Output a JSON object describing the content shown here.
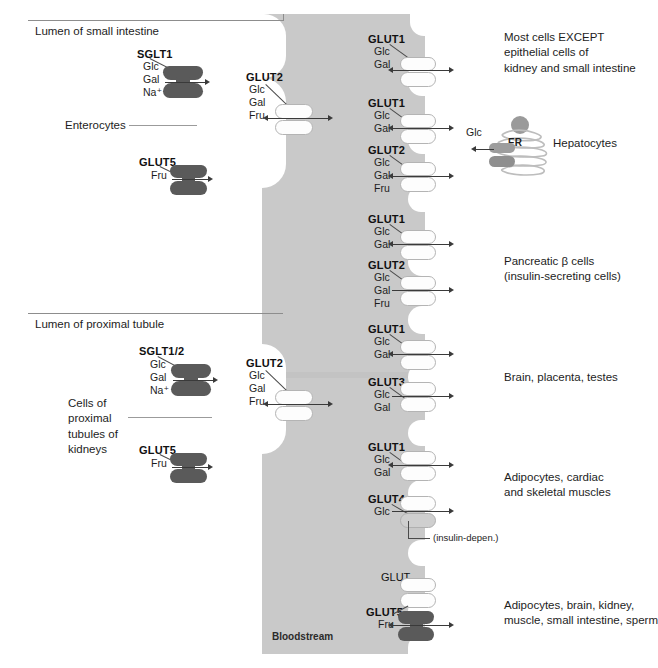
{
  "figure": {
    "bloodstream_label": "Bloodstream"
  },
  "colors": {
    "bloodstream_fill": "#c9c9c9",
    "dark_transporter": "#5a5a5a",
    "light_transporter": "#fdfdfd",
    "medium_transporter": "#cfcfcf",
    "text": "#1d1d1d",
    "rule": "#8d8d8d"
  },
  "panels": {
    "intestine": {
      "lumen_label": "Lumen of small intestine",
      "cell_label": "Enterocytes",
      "apical": [
        {
          "name": "SGLT1",
          "substrates": [
            "Glc",
            "Gal",
            "Na⁺"
          ],
          "direction": "right"
        },
        {
          "name": "GLUT5",
          "substrates": [
            "Fru"
          ],
          "direction": "right"
        }
      ],
      "basolateral": [
        {
          "name": "GLUT2",
          "substrates": [
            "Glc",
            "Gal",
            "Fru"
          ],
          "direction": "both"
        }
      ]
    },
    "kidney": {
      "lumen_label": "Lumen of proximal tubule",
      "cell_label": "Cells of\nproximal\ntubules of\nkidneys",
      "apical": [
        {
          "name": "SGLT1/2",
          "substrates": [
            "Glc",
            "Gal",
            "Na⁺"
          ],
          "direction": "right"
        },
        {
          "name": "GLUT5",
          "substrates": [
            "Fru"
          ],
          "direction": "right"
        }
      ],
      "basolateral": [
        {
          "name": "GLUT2",
          "substrates": [
            "Glc",
            "Gal",
            "Fru"
          ],
          "direction": "both"
        }
      ]
    },
    "bloodstream_right": {
      "transporters": [
        {
          "name": "GLUT1",
          "substrates": [
            "Glc",
            "Gal"
          ],
          "direction": "both",
          "style": "light"
        },
        {
          "name": "GLUT1",
          "substrates": [
            "Glc",
            "Gal"
          ],
          "direction": "both",
          "style": "light"
        },
        {
          "name": "GLUT2",
          "substrates": [
            "Glc",
            "Gal",
            "Fru"
          ],
          "direction": "both",
          "style": "light"
        },
        {
          "name": "GLUT1",
          "substrates": [
            "Glc",
            "Gal"
          ],
          "direction": "both",
          "style": "light"
        },
        {
          "name": "GLUT2",
          "substrates": [
            "Glc",
            "Gal",
            "Fru"
          ],
          "direction": "right",
          "style": "light"
        },
        {
          "name": "GLUT1",
          "substrates": [
            "Glc",
            "Gal"
          ],
          "direction": "both",
          "style": "light"
        },
        {
          "name": "GLUT3",
          "substrates": [
            "Glc",
            "Gal"
          ],
          "direction": "right",
          "style": "light"
        },
        {
          "name": "GLUT1",
          "substrates": [
            "Glc",
            "Gal"
          ],
          "direction": "both",
          "style": "light"
        },
        {
          "name": "GLUT4",
          "substrates": [
            "Glc"
          ],
          "direction": "right",
          "style": "light",
          "note": "(insulin-depen.)"
        },
        {
          "name": "GLUT",
          "substrates": [],
          "direction": "none",
          "style": "light",
          "bold": false
        },
        {
          "name": "GLUT5",
          "substrates": [
            "Fru"
          ],
          "direction": "both",
          "style": "dark"
        }
      ],
      "tissue_labels": [
        {
          "text": "Most cells EXCEPT\nepithelial cells of\nkidney and small intestine"
        },
        {
          "text": "Hepatocytes"
        },
        {
          "text": "Pancreatic β cells\n(insulin-secreting cells)"
        },
        {
          "text": "Brain, placenta, testes"
        },
        {
          "text": "Adipocytes, cardiac\nand skeletal muscles"
        },
        {
          "text": "Adipocytes, brain, kidney,\nmuscle, small intestine, sperm"
        }
      ],
      "hepatocyte": {
        "organelle_label": "ER",
        "substrate": "Glc"
      }
    }
  }
}
